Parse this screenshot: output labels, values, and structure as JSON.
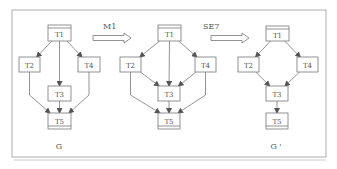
{
  "figure": {
    "colors": {
      "stroke": "#777777",
      "text": "#555555",
      "frame": "#999999",
      "background": "#ffffff"
    }
  },
  "graphs": [
    {
      "id": "G",
      "label": "G",
      "nodes": [
        {
          "id": "T1",
          "label": "T1",
          "x": 48,
          "y": 25,
          "w": 23,
          "h": 16,
          "style": "double-top"
        },
        {
          "id": "T2",
          "label": "T2",
          "x": 19,
          "y": 57,
          "w": 21,
          "h": 15
        },
        {
          "id": "T4",
          "label": "T4",
          "x": 78,
          "y": 57,
          "w": 22,
          "h": 15
        },
        {
          "id": "T3",
          "label": "T3",
          "x": 48,
          "y": 86,
          "w": 23,
          "h": 15
        },
        {
          "id": "T5",
          "label": "T5",
          "x": 48,
          "y": 113,
          "w": 23,
          "h": 16,
          "style": "double-bottom"
        }
      ],
      "edges": [
        [
          "T1",
          "T2"
        ],
        [
          "T1",
          "T3"
        ],
        [
          "T1",
          "T4"
        ],
        [
          "T2",
          "T5"
        ],
        [
          "T3",
          "T5"
        ],
        [
          "T4",
          "T5"
        ]
      ],
      "label_pos": {
        "x": 59,
        "y": 149
      }
    },
    {
      "id": "G_mid",
      "label": "",
      "nodes": [
        {
          "id": "T1",
          "label": "T1",
          "x": 158,
          "y": 25,
          "w": 23,
          "h": 16,
          "style": "double-top"
        },
        {
          "id": "T2",
          "label": "T2",
          "x": 120,
          "y": 57,
          "w": 21,
          "h": 15
        },
        {
          "id": "T4",
          "label": "T4",
          "x": 195,
          "y": 57,
          "w": 21,
          "h": 15
        },
        {
          "id": "T3",
          "label": "T3",
          "x": 158,
          "y": 86,
          "w": 22,
          "h": 15
        },
        {
          "id": "T5",
          "label": "T5",
          "x": 158,
          "y": 113,
          "w": 22,
          "h": 16,
          "style": "double-bottom"
        }
      ],
      "edges": [
        [
          "T1",
          "T2"
        ],
        [
          "T1",
          "T3"
        ],
        [
          "T1",
          "T4"
        ],
        [
          "T2",
          "T3"
        ],
        [
          "T4",
          "T3"
        ],
        [
          "T2",
          "T5"
        ],
        [
          "T3",
          "T5"
        ],
        [
          "T4",
          "T5"
        ]
      ]
    },
    {
      "id": "G_prime",
      "label": "G '",
      "nodes": [
        {
          "id": "T1",
          "label": "T1",
          "x": 266,
          "y": 26,
          "w": 23,
          "h": 15,
          "style": "double-top"
        },
        {
          "id": "T2",
          "label": "T2",
          "x": 238,
          "y": 57,
          "w": 21,
          "h": 15
        },
        {
          "id": "T4",
          "label": "T4",
          "x": 297,
          "y": 57,
          "w": 21,
          "h": 15
        },
        {
          "id": "T3",
          "label": "T3",
          "x": 266,
          "y": 86,
          "w": 22,
          "h": 15
        },
        {
          "id": "T5",
          "label": "T5",
          "x": 266,
          "y": 113,
          "w": 22,
          "h": 16,
          "style": "double-bottom"
        }
      ],
      "edges": [
        [
          "T1",
          "T2"
        ],
        [
          "T1",
          "T4"
        ],
        [
          "T2",
          "T3"
        ],
        [
          "T4",
          "T3"
        ],
        [
          "T3",
          "T5"
        ]
      ],
      "label_pos": {
        "x": 276,
        "y": 149
      }
    }
  ],
  "transforms": [
    {
      "id": "M1",
      "label": "M1",
      "label_x": 103,
      "label_y": 29,
      "x1": 93,
      "x2": 131,
      "y": 38
    },
    {
      "id": "SE7",
      "label": "SE7",
      "label_x": 203,
      "label_y": 29,
      "x1": 211,
      "x2": 249,
      "y": 38
    }
  ]
}
